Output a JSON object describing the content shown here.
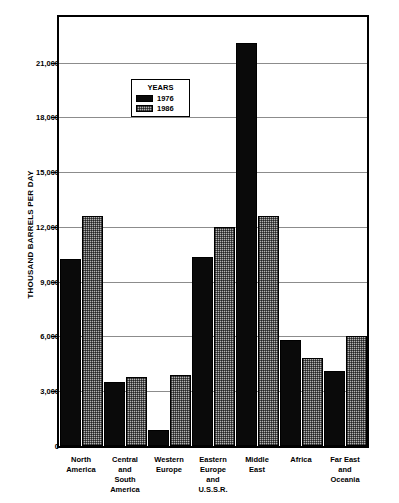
{
  "chart_data": {
    "type": "bar",
    "title": "",
    "xlabel": "",
    "ylabel": "THOUSAND BARRELS PER DAY",
    "ylim": [
      0,
      23500
    ],
    "yticks": [
      0,
      3000,
      6000,
      9000,
      12000,
      15000,
      18000,
      21000
    ],
    "ytick_labels": [
      "0",
      "3,000",
      "6,000",
      "9,000",
      "12,000",
      "15,000",
      "18,000",
      "21,000"
    ],
    "grid": true,
    "legend_position": "inside-upper-left",
    "legend_title": "YEARS",
    "categories": [
      "North\nAmerica",
      "Central\nand\nSouth\nAmerica",
      "Western\nEurope",
      "Eastern\nEurope\nand\nU.S.S.R.",
      "Middle\nEast",
      "Africa",
      "Far East\nand\nOceania"
    ],
    "series": [
      {
        "name": "1976",
        "color": "#0a0a0a",
        "values": [
          10250,
          3500,
          900,
          10350,
          22100,
          5800,
          4100
        ]
      },
      {
        "name": "1986",
        "color": "#b3b3b3",
        "values": [
          12600,
          3800,
          3900,
          12000,
          12600,
          4800,
          6000
        ]
      }
    ]
  }
}
